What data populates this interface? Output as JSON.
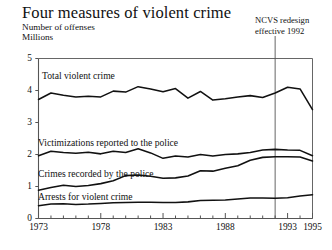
{
  "figure": {
    "title": "Four measures of violent crime",
    "axis_label_line1": "Number of offenses",
    "axis_label_line2": "Millions",
    "annotation_line1": "NCVS redesign",
    "annotation_line2": "effective 1992"
  },
  "ticks": {
    "y": [
      "5",
      "4",
      "3",
      "2",
      "1",
      "0"
    ],
    "x": [
      "1973",
      "1978",
      "1983",
      "1988",
      "1993",
      "1995"
    ]
  },
  "series_labels": {
    "total": "Total violent crime",
    "victimizations": "Victimizations reported to the police",
    "recorded": "Crimes recorded by the police",
    "arrests": "Arrests for violent crime"
  },
  "colors": {
    "line": "#111111",
    "frame": "#555555",
    "background": "#ffffff"
  },
  "chart_data": {
    "type": "line",
    "title": "Four measures of violent crime",
    "xlabel": "",
    "ylabel": "Number of offenses, Millions",
    "xlim": [
      1973,
      1995
    ],
    "ylim": [
      0,
      5
    ],
    "grid": false,
    "legend": "inline-labels",
    "yticks": [
      0,
      1,
      2,
      3,
      4,
      5
    ],
    "xticks": [
      1973,
      1978,
      1983,
      1988,
      1993,
      1995
    ],
    "annotations": [
      {
        "text": "NCVS redesign effective 1992",
        "x": 1992,
        "type": "vertical-line-with-caption"
      }
    ],
    "x": [
      1973,
      1974,
      1975,
      1976,
      1977,
      1978,
      1979,
      1980,
      1981,
      1982,
      1983,
      1984,
      1985,
      1986,
      1987,
      1988,
      1989,
      1990,
      1991,
      1992,
      1993,
      1994,
      1995
    ],
    "series": [
      {
        "name": "Total violent crime",
        "values": [
          3.72,
          3.92,
          3.85,
          3.8,
          3.82,
          3.8,
          3.98,
          3.95,
          4.12,
          4.05,
          3.96,
          4.06,
          3.76,
          3.97,
          3.7,
          3.74,
          3.8,
          3.84,
          3.78,
          3.92,
          4.1,
          4.05,
          3.4
        ]
      },
      {
        "name": "Victimizations reported to the police",
        "values": [
          1.96,
          2.1,
          2.06,
          2.04,
          2.07,
          2.02,
          2.1,
          2.06,
          2.18,
          2.05,
          1.88,
          1.95,
          1.92,
          2.0,
          1.95,
          2.0,
          2.02,
          2.06,
          2.14,
          2.16,
          2.14,
          2.13,
          1.96
        ]
      },
      {
        "name": "Crimes recorded by the police",
        "values": [
          0.88,
          0.97,
          1.04,
          1.0,
          1.03,
          1.09,
          1.18,
          1.34,
          1.36,
          1.32,
          1.26,
          1.27,
          1.33,
          1.49,
          1.48,
          1.57,
          1.65,
          1.82,
          1.91,
          1.93,
          1.93,
          1.92,
          1.8
        ]
      },
      {
        "name": "Arrests for violent crime",
        "values": [
          0.4,
          0.45,
          0.46,
          0.44,
          0.45,
          0.47,
          0.49,
          0.5,
          0.51,
          0.51,
          0.5,
          0.5,
          0.52,
          0.56,
          0.57,
          0.58,
          0.61,
          0.64,
          0.64,
          0.63,
          0.65,
          0.7,
          0.74
        ]
      }
    ]
  }
}
